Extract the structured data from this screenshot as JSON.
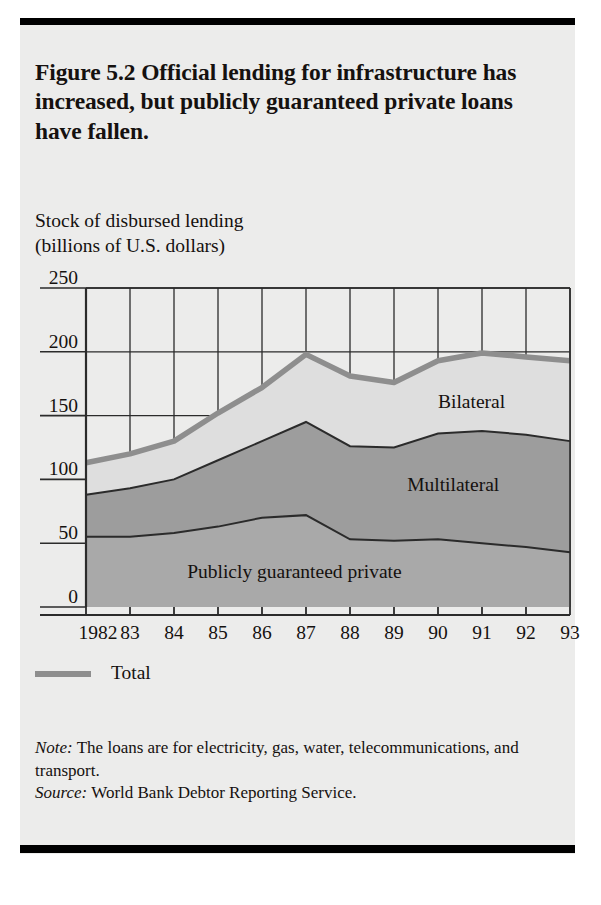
{
  "figure": {
    "title": "Figure 5.2  Official lending for infrastructure has increased, but publicly guaranteed private loans have fallen.",
    "axis_title_line1": "Stock of disbursed lending",
    "axis_title_line2": "(billions of U.S. dollars)"
  },
  "legend": {
    "total_label": "Total",
    "swatch_color": "#8e8e8e"
  },
  "labels": {
    "bilateral": "Bilateral",
    "multilateral": "Multilateral",
    "private": "Publicly guaranteed private"
  },
  "notes": {
    "note_prefix": "Note:",
    "note_text": " The loans are for electricity, gas, water, telecommunications, and transport.",
    "source_prefix": "Source:",
    "source_text": " World Bank Debtor Reporting Service."
  },
  "colors": {
    "bilateral_fill": "#dedede",
    "multilateral_fill": "#9d9d9d",
    "private_fill": "#a9a9a9",
    "total_line": "#8e8e8e",
    "band_line": "#2b2b2b",
    "grid": "#2b2b2b",
    "panel": "#ececeb",
    "ink": "#15110f"
  },
  "chart_data": {
    "type": "area",
    "stacked": true,
    "title": "Stock of disbursed lending (billions of U.S. dollars)",
    "xlabel": "",
    "ylabel": "Stock of disbursed lending (billions of U.S. dollars)",
    "ylim": [
      0,
      250
    ],
    "yticks": [
      0,
      50,
      100,
      150,
      200,
      250
    ],
    "ytick_labels": [
      "0",
      "50",
      "100",
      "150",
      "200",
      "250"
    ],
    "grid": true,
    "legend_position": "below-axis",
    "x": [
      1982,
      1983,
      1984,
      1985,
      1986,
      1987,
      1988,
      1989,
      1990,
      1991,
      1992,
      1993
    ],
    "categories": [
      "1982",
      "83",
      "84",
      "85",
      "86",
      "87",
      "88",
      "89",
      "90",
      "91",
      "92",
      "93"
    ],
    "series": [
      {
        "name": "Publicly guaranteed private",
        "color": "#a9a9a9",
        "values": [
          55,
          55,
          58,
          63,
          70,
          72,
          53,
          52,
          53,
          50,
          47,
          43
        ]
      },
      {
        "name": "Multilateral",
        "color": "#9d9d9d",
        "values": [
          33,
          38,
          42,
          52,
          60,
          73,
          73,
          73,
          83,
          88,
          88,
          87
        ]
      },
      {
        "name": "Bilateral",
        "color": "#dedede",
        "values": [
          25,
          27,
          30,
          37,
          42,
          53,
          55,
          51,
          57,
          61,
          61,
          63
        ]
      }
    ],
    "cumulative": {
      "private": [
        55,
        55,
        58,
        63,
        70,
        72,
        53,
        52,
        53,
        50,
        47,
        43
      ],
      "private_plus_multilateral": [
        88,
        93,
        100,
        115,
        130,
        145,
        126,
        125,
        136,
        138,
        135,
        130
      ],
      "total": [
        113,
        120,
        130,
        152,
        172,
        198,
        181,
        176,
        193,
        199,
        196,
        193
      ]
    },
    "annotations": [
      {
        "text": "Bilateral",
        "x": 1990,
        "y": 160
      },
      {
        "text": "Multilateral",
        "x": 1989.3,
        "y": 95
      },
      {
        "text": "Publicly guaranteed private",
        "x": 1984.3,
        "y": 27
      }
    ]
  }
}
